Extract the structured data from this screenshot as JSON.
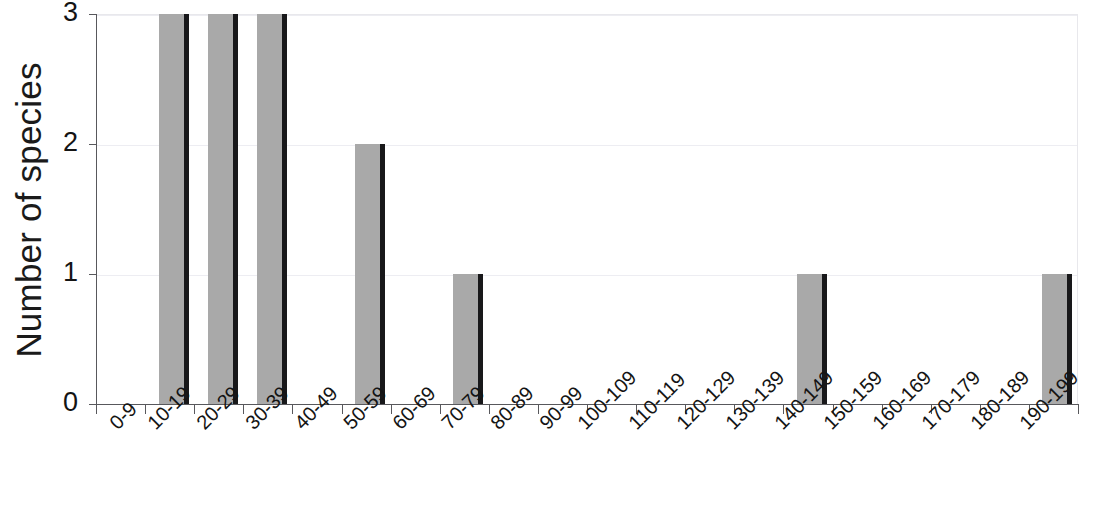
{
  "chart_data": {
    "type": "bar",
    "title": "",
    "subtitle": "",
    "xlabel": "",
    "ylabel": "Number of species",
    "categories": [
      "0-9",
      "10-19",
      "20-29",
      "30-39",
      "40-49",
      "50-59",
      "60-69",
      "70-79",
      "80-89",
      "90-99",
      "100-109",
      "110-119",
      "120-129",
      "130-139",
      "140-149",
      "150-159",
      "160-169",
      "170-179",
      "180-189",
      "190-199"
    ],
    "values": [
      0,
      3,
      3,
      3,
      0,
      2,
      0,
      1,
      0,
      0,
      0,
      0,
      0,
      0,
      1,
      0,
      0,
      0,
      0,
      1
    ],
    "ylim": [
      0,
      3
    ],
    "yticks": [
      0,
      1,
      2,
      3
    ],
    "ytick_labels": [
      "0",
      "1",
      "2",
      "3"
    ],
    "grid": true,
    "grid_axis": "y",
    "legend": false,
    "legend_position": "none",
    "bar_fill_color": "#a9a9a9",
    "bar_edge_color": "#18181a",
    "gridline_color": "#ededf2",
    "axis_color": "#58585c",
    "background_color": "#ffffff",
    "xtick_label_rotation": -45
  },
  "axes": {
    "y_title": "Number of species"
  }
}
